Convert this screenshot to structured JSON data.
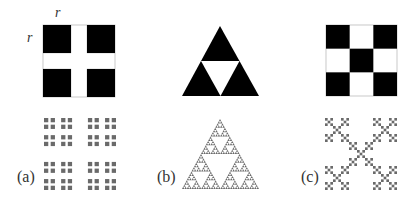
{
  "figure": {
    "background": "#ffffff",
    "fill_color": "#000000",
    "fractal_color": "#6a6a6a",
    "outline_color": "#bbbbbb",
    "dimension_labels": {
      "top": "r",
      "left": "r"
    },
    "panels": [
      {
        "id": "a",
        "label": "(a)",
        "generator": {
          "shape": "square-2x2-corners",
          "description": "Four black squares of side r at the corners of a unit square, separated by a white cross",
          "grid": 2,
          "ratio_r": 0.39
        },
        "fractal": {
          "type": "cantor-dust-2x2",
          "iterations": 3
        }
      },
      {
        "id": "b",
        "label": "(b)",
        "generator": {
          "shape": "triangle-3-sub",
          "description": "Black equilateral triangle with white inverted central triangle (three half-size black triangles)",
          "ratio_r": 0.5
        },
        "fractal": {
          "type": "sierpinski-triangle",
          "iterations": 5
        }
      },
      {
        "id": "c",
        "label": "(c)",
        "generator": {
          "shape": "square-3x3-x",
          "description": "3x3 grid with black squares at four corners and the center (X pattern)",
          "grid": 3,
          "ratio_r": 0.3333
        },
        "fractal": {
          "type": "vicsek-x",
          "iterations": 3
        }
      }
    ]
  }
}
